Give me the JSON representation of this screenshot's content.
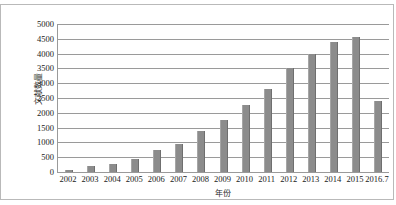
{
  "chart_data": {
    "type": "bar",
    "title": "",
    "xlabel": "年份",
    "ylabel": "文献数量",
    "categories": [
      "2002",
      "2003",
      "2004",
      "2005",
      "2006",
      "2007",
      "2008",
      "2009",
      "2010",
      "2011",
      "2012",
      "2013",
      "2014",
      "2015",
      "2016.7"
    ],
    "values": [
      80,
      200,
      280,
      450,
      750,
      950,
      1400,
      1750,
      2250,
      2800,
      3500,
      4000,
      4400,
      4550,
      2400
    ],
    "ylim": [
      0,
      5000
    ],
    "yticks": [
      0,
      500,
      1000,
      1500,
      2000,
      2500,
      3000,
      3500,
      4000,
      4500,
      5000
    ],
    "ytick_labels": [
      "0",
      "500",
      "1000",
      "1500",
      "2000",
      "2500",
      "3000",
      "3500",
      "4000",
      "4500",
      "5000"
    ],
    "grid": true,
    "legend": false,
    "series": [
      {
        "name": "文献数量",
        "color": "#8c8c8c",
        "values": [
          80,
          200,
          280,
          450,
          750,
          950,
          1400,
          1750,
          2250,
          2800,
          3500,
          4000,
          4400,
          4550,
          2400
        ]
      }
    ],
    "colors": {
      "bar": "#8c8c8c",
      "gridline": "#9a9a9a",
      "axis": "#9a9a9a",
      "frame": "#b9b9b9",
      "text": "#1a1a1a",
      "background": "#ffffff"
    }
  }
}
